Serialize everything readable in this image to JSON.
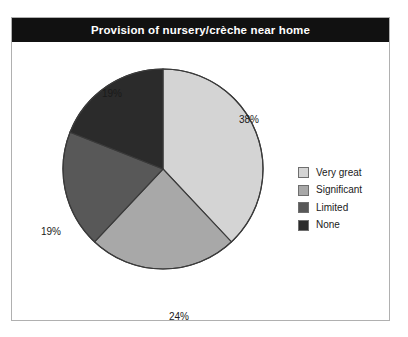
{
  "chart_data": {
    "type": "pie",
    "title": "Provision of nursery/crèche near home",
    "xlabel": "",
    "ylabel": "",
    "legend_position": "right",
    "grid": false,
    "start_angle_clock": "12 o'clock",
    "direction": "clockwise",
    "categories": [
      "Very great",
      "Significant",
      "Limited",
      "None"
    ],
    "values": [
      38,
      24,
      19,
      19
    ],
    "value_unit": "%",
    "data_labels": [
      "38%",
      "24%",
      "19%",
      "19%"
    ],
    "slice_colors": [
      "#d4d4d4",
      "#a8a8a8",
      "#585858",
      "#2b2b2b"
    ],
    "slices": [
      {
        "label": "Very great",
        "value": 38,
        "data_label": "38%",
        "color": "#d4d4d4"
      },
      {
        "label": "Significant",
        "value": 24,
        "data_label": "24%",
        "color": "#a8a8a8"
      },
      {
        "label": "Limited",
        "value": 19,
        "data_label": "19%",
        "color": "#585858"
      },
      {
        "label": "None",
        "value": 19,
        "data_label": "19%",
        "color": "#2b2b2b"
      }
    ]
  },
  "title": {
    "text": "Provision of nursery/crèche near home",
    "background": "#111111",
    "color": "#ffffff"
  },
  "labels": {
    "very_great": "38%",
    "significant": "24%",
    "limited": "19%",
    "none": "19%"
  },
  "legend": {
    "items": [
      {
        "label": "Very great",
        "color": "#d4d4d4"
      },
      {
        "label": "Significant",
        "color": "#a8a8a8"
      },
      {
        "label": "Limited",
        "color": "#585858"
      },
      {
        "label": "None",
        "color": "#2b2b2b"
      }
    ]
  },
  "frame": {
    "border_color": "#b0b0b0",
    "background": "#ffffff"
  }
}
